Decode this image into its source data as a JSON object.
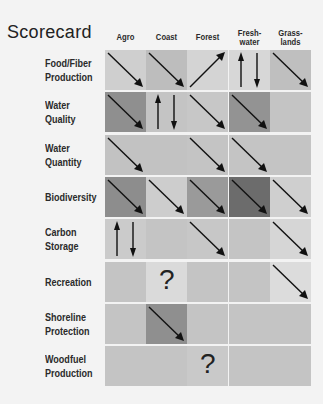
{
  "title": "Scorecard",
  "columns": [
    "Agro",
    "Coast",
    "Forest",
    "Fresh-\nwater",
    "Grass-\nlands"
  ],
  "rows": [
    {
      "label": "Food/Fiber\nProduction",
      "cells": [
        {
          "shade": "#cfcfcf",
          "symbol": "down"
        },
        {
          "shade": "#bdbdbd",
          "symbol": "down"
        },
        {
          "shade": "#d4d4d4",
          "symbol": "up"
        },
        {
          "shade": "#d7d7d7",
          "symbol": "mixed"
        },
        {
          "shade": "#bfbfbf",
          "symbol": "down"
        }
      ]
    },
    {
      "label": "Water\nQuality",
      "cells": [
        {
          "shade": "#8f8f8f",
          "symbol": "down"
        },
        {
          "shade": "#c4c4c4",
          "symbol": "mixed"
        },
        {
          "shade": "#c7c7c7",
          "symbol": "down"
        },
        {
          "shade": "#939393",
          "symbol": "down"
        },
        {
          "shade": "#c4c4c4",
          "symbol": "none"
        }
      ]
    },
    {
      "label": "Water\nQuantity",
      "cells": [
        {
          "shade": "#c2c2c2",
          "symbol": "down"
        },
        {
          "shade": "#c2c2c2",
          "symbol": "none"
        },
        {
          "shade": "#c4c4c4",
          "symbol": "down"
        },
        {
          "shade": "#c4c4c4",
          "symbol": "down"
        },
        {
          "shade": "#c4c4c4",
          "symbol": "none"
        }
      ]
    },
    {
      "label": "Biodiversity",
      "cells": [
        {
          "shade": "#8d8d8d",
          "symbol": "down"
        },
        {
          "shade": "#cdcdcd",
          "symbol": "down"
        },
        {
          "shade": "#9a9a9a",
          "symbol": "down"
        },
        {
          "shade": "#6c6c6c",
          "symbol": "down"
        },
        {
          "shade": "#cfcfcf",
          "symbol": "down"
        }
      ]
    },
    {
      "label": "Carbon\nStorage",
      "cells": [
        {
          "shade": "#cbcbcb",
          "symbol": "mixed"
        },
        {
          "shade": "#c4c4c4",
          "symbol": "none"
        },
        {
          "shade": "#c7c7c7",
          "symbol": "down"
        },
        {
          "shade": "#c4c4c4",
          "symbol": "none"
        },
        {
          "shade": "#d6d6d6",
          "symbol": "down"
        }
      ]
    },
    {
      "label": "Recreation",
      "cells": [
        {
          "shade": "#c4c4c4",
          "symbol": "none"
        },
        {
          "shade": "#dadada",
          "symbol": "question"
        },
        {
          "shade": "#c4c4c4",
          "symbol": "none"
        },
        {
          "shade": "#c4c4c4",
          "symbol": "none"
        },
        {
          "shade": "#dcdcdc",
          "symbol": "down"
        }
      ]
    },
    {
      "label": "Shoreline\nProtection",
      "cells": [
        {
          "shade": "#c4c4c4",
          "symbol": "none"
        },
        {
          "shade": "#8f8f8f",
          "symbol": "down"
        },
        {
          "shade": "#c4c4c4",
          "symbol": "none"
        },
        {
          "shade": "#c4c4c4",
          "symbol": "none"
        },
        {
          "shade": "#c4c4c4",
          "symbol": "none"
        }
      ]
    },
    {
      "label": "Woodfuel\nProduction",
      "cells": [
        {
          "shade": "#c4c4c4",
          "symbol": "none"
        },
        {
          "shade": "#c4c4c4",
          "symbol": "none"
        },
        {
          "shade": "#c9c9c9",
          "symbol": "question"
        },
        {
          "shade": "#c4c4c4",
          "symbol": "none"
        },
        {
          "shade": "#c4c4c4",
          "symbol": "none"
        }
      ]
    }
  ],
  "symbols": {
    "question_mark": "?"
  },
  "grid": {
    "left": 105,
    "top": 50,
    "col_step": 41.2,
    "row_step": 42.3
  }
}
